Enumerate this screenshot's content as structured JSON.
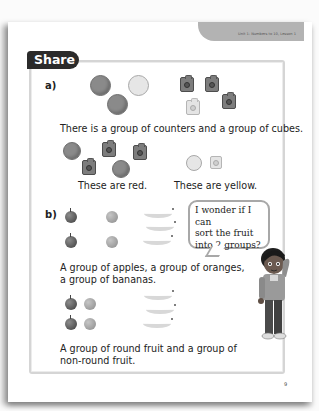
{
  "header": {
    "unit_label": "Unit 1: Numbers to 10, Lesson 1"
  },
  "section": {
    "title": "Share"
  },
  "part_a": {
    "label": "a)",
    "counters": [
      "red",
      "yellow",
      "red"
    ],
    "cubes": [
      "red",
      "red",
      "yellow",
      "red"
    ],
    "sentence": "There is a group of counters and a group of cubes.",
    "red_group_caption": "These are red.",
    "yellow_group_caption": "These are yellow."
  },
  "part_b": {
    "label": "b)",
    "fruit": [
      "apple",
      "apple",
      "orange",
      "orange",
      "banana",
      "banana",
      "banana"
    ],
    "speech_bubble": {
      "line1": "I wonder if I can",
      "line2": "sort the fruit",
      "line3": "into 2 groups?"
    },
    "sentence1_line1": "A group of apples, a group of oranges,",
    "sentence1_line2": "a group of bananas.",
    "sentence2_line1": "A group of round fruit and a group of",
    "sentence2_line2": "non-round fruit."
  },
  "footer": {
    "page_number": "9"
  }
}
